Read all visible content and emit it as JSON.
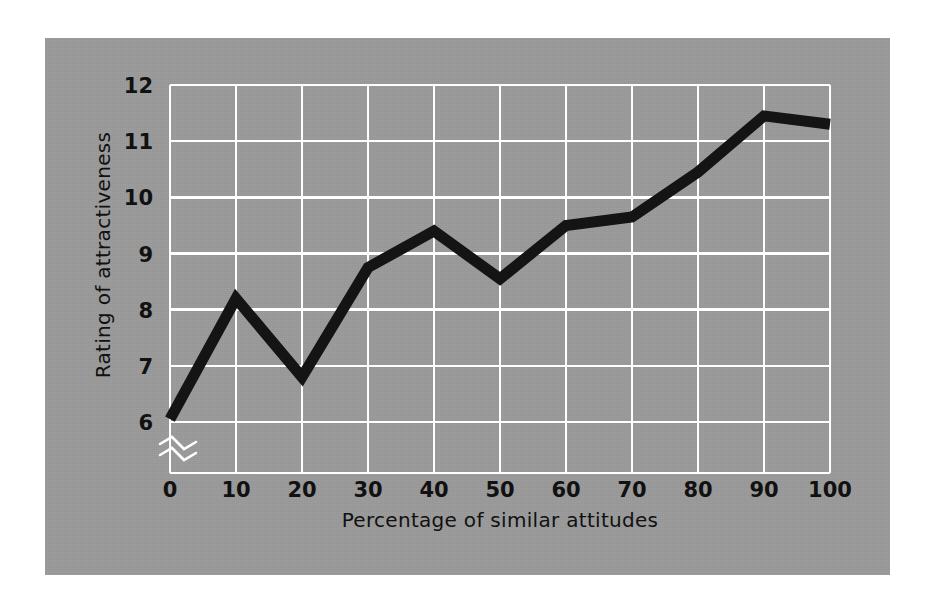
{
  "figure": {
    "background_color": "#ffffff",
    "panel_color": "#9a9a9a",
    "grid_color": "#ffffff",
    "line_color": "#141414"
  },
  "chart_data": {
    "type": "line",
    "title": "",
    "xlabel": "Percentage of similar attitudes",
    "ylabel": "Rating of attractiveness",
    "x": [
      0,
      10,
      20,
      30,
      40,
      50,
      60,
      70,
      80,
      90,
      100
    ],
    "values": [
      6.05,
      8.2,
      6.8,
      8.75,
      9.4,
      8.55,
      9.5,
      9.65,
      10.45,
      11.45,
      11.3
    ],
    "xtick_labels": [
      "0",
      "10",
      "20",
      "30",
      "40",
      "50",
      "60",
      "70",
      "80",
      "90",
      "100"
    ],
    "ytick_labels": [
      "6",
      "7",
      "8",
      "9",
      "10",
      "11",
      "12"
    ],
    "yticks": [
      6,
      7,
      8,
      9,
      10,
      11,
      12
    ],
    "xlim": [
      0,
      100
    ],
    "ylim": [
      6,
      12
    ],
    "grid": true,
    "legend": null,
    "y_axis_break": true,
    "y_axis_break_symbol": "≈",
    "line_width_px": 11
  }
}
